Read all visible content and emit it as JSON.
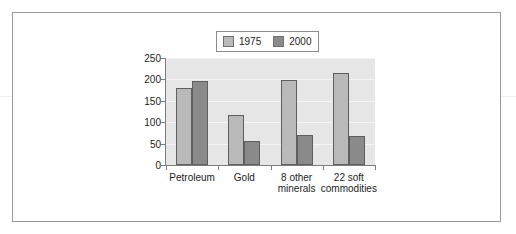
{
  "chart_data": {
    "type": "bar",
    "title": "",
    "xlabel": "",
    "ylabel": "",
    "categories": [
      "Petroleum",
      "Gold",
      "8 other\nminerals",
      "22 soft\ncommodities"
    ],
    "series": [
      {
        "name": "1975",
        "values": [
          180,
          118,
          198,
          215
        ],
        "color": "#b9b9b9"
      },
      {
        "name": "2000",
        "values": [
          196,
          56,
          70,
          68
        ],
        "color": "#8a8a8a"
      }
    ],
    "ylim": [
      0,
      250
    ],
    "yticks": [
      0,
      50,
      100,
      150,
      200,
      250
    ],
    "ytick_labels": [
      "0",
      "50",
      "100",
      "150",
      "200",
      "250"
    ],
    "grid": true,
    "legend_position": "top-center",
    "plot_background": "#e6e6e6",
    "axis_color": "#7d7d7d",
    "bar_edge_color": "#5e5e5e"
  },
  "legend": {
    "entries": [
      {
        "label": "1975"
      },
      {
        "label": "2000"
      }
    ]
  },
  "frame": {
    "border_color": "#9a9a9a"
  }
}
